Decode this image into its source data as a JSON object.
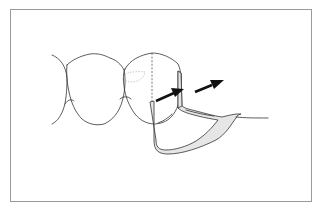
{
  "figure": {
    "elements": [
      {
        "name": "left-tooth",
        "type": "crown-outline"
      },
      {
        "name": "right-tooth",
        "type": "crown-outline"
      },
      {
        "name": "survey-line",
        "type": "dashed-line"
      },
      {
        "name": "clasp-arm",
        "type": "shaded-framework"
      },
      {
        "name": "arrow-1",
        "type": "arrow",
        "direction": "up-right"
      },
      {
        "name": "arrow-2",
        "type": "arrow",
        "direction": "up-right"
      }
    ],
    "colors": {
      "outline": "#333333",
      "clasp_fill": "#e6e6e6",
      "arrow": "#111111",
      "frame_border": "#9a9a9a"
    }
  }
}
